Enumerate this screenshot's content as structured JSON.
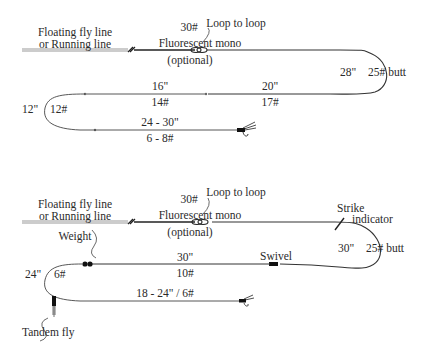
{
  "diagram_1": {
    "fly_line_label_1": "Floating fly line",
    "fly_line_label_2": "or Running line",
    "mono_weight": "30#",
    "mono_label": "Fluorescent mono",
    "mono_optional": "(optional)",
    "loop_label": "Loop to loop",
    "butt_length": "28\"",
    "butt_label": "25# butt",
    "section_20_length": "20\"",
    "section_20_weight": "17#",
    "section_16_length": "16\"",
    "section_16_weight": "14#",
    "section_12_length": "12\"",
    "section_12_weight": "12#",
    "tippet_length": "24 - 30\"",
    "tippet_weight": "6 - 8#"
  },
  "diagram_2": {
    "fly_line_label_1": "Floating fly line",
    "fly_line_label_2": "or Running line",
    "mono_weight": "30#",
    "mono_label": "Fluorescent mono",
    "mono_optional": "(optional)",
    "loop_label": "Loop to loop",
    "strike_label_1": "Strike",
    "strike_label_2": "indicator",
    "butt_length": "30\"",
    "butt_label": "25# butt",
    "swivel_label": "Swivel",
    "section_30_length": "30\"",
    "section_30_weight": "10#",
    "weight_label": "Weight",
    "section_24_length": "24\"",
    "section_24_weight": "6#",
    "tandem_label": "Tandem fly",
    "tandem_tippet": "18 - 24\" / 6#"
  },
  "colors": {
    "line": "#333333",
    "fly_line": "#888888",
    "background": "#ffffff"
  }
}
